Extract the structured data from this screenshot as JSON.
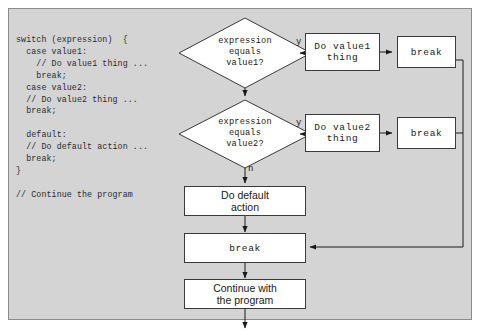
{
  "diagram": {
    "colors": {
      "panel_background": "#d4d4d4",
      "node_fill": "#ffffff",
      "stroke": "#3a3a3a",
      "text": "#1a1a1a"
    },
    "code": "switch (expression)  {\n  case value1:\n    // Do value1 thing ...\n    break;\n  case value2:\n  // Do value2 thing ...\n  break;\n\n  default:\n  // Do default action ...\n  break;\n}\n\n// Continue the program",
    "decisions": [
      {
        "id": "decision-value1",
        "line1": "expression",
        "line2": "equals",
        "line3": "value1?",
        "yes_label": "y"
      },
      {
        "id": "decision-value2",
        "line1": "expression",
        "line2": "equals",
        "line3": "value2?",
        "yes_label": "y",
        "no_label": "n"
      }
    ],
    "processes": [
      {
        "id": "do-value1-thing",
        "line1": "Do value1",
        "line2": "thing"
      },
      {
        "id": "break-value1",
        "line1": "break"
      },
      {
        "id": "do-value2-thing",
        "line1": "Do value2",
        "line2": "thing"
      },
      {
        "id": "break-value2",
        "line1": "break"
      },
      {
        "id": "do-default-action",
        "line1": "Do default",
        "line2": "action"
      },
      {
        "id": "break-default",
        "line1": "break"
      },
      {
        "id": "continue-program",
        "line1": "Continue with",
        "line2": "the program"
      }
    ]
  }
}
